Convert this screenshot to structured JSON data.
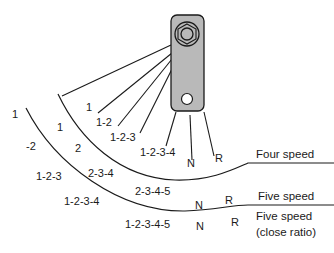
{
  "diagram": {
    "type": "gear-shift-pattern",
    "component": "selector lever",
    "rows": [
      {
        "name": "Four speed",
        "labels": [
          {
            "text": "1",
            "x": 86,
            "y": 108
          },
          {
            "text": "1-2",
            "x": 96,
            "y": 123
          },
          {
            "text": "1-2-3",
            "x": 110,
            "y": 138
          },
          {
            "text": "1-2-3-4",
            "x": 140,
            "y": 152
          },
          {
            "text": "N",
            "x": 187,
            "y": 163
          },
          {
            "text": "R",
            "x": 215,
            "y": 158
          }
        ]
      },
      {
        "name": "Five speed",
        "labels": [
          {
            "text": "1",
            "x": 57,
            "y": 127
          },
          {
            "text": "2",
            "x": 75,
            "y": 148
          },
          {
            "text": "2-3-4",
            "x": 88,
            "y": 173
          },
          {
            "text": "2-3-4-5",
            "x": 135,
            "y": 191
          },
          {
            "text": "N",
            "x": 195,
            "y": 205
          },
          {
            "text": "R",
            "x": 225,
            "y": 200
          }
        ]
      },
      {
        "name": "Five speed (close ratio)",
        "name_line1": "Five speed",
        "name_line2": "(close ratio)",
        "labels": [
          {
            "text": "1",
            "x": 12,
            "y": 114
          },
          {
            "text": "-2",
            "x": 26,
            "y": 146
          },
          {
            "text": "1-2-3",
            "x": 36,
            "y": 176
          },
          {
            "text": "1-2-3-4",
            "x": 64,
            "y": 201
          },
          {
            "text": "1-2-3-4-5",
            "x": 125,
            "y": 224
          },
          {
            "text": "N",
            "x": 196,
            "y": 226
          },
          {
            "text": "R",
            "x": 231,
            "y": 222
          }
        ]
      }
    ],
    "colors": {
      "line": "#1a1a1a",
      "lever_fill": "#b9b9b9",
      "lever_stroke": "#1a1a1a",
      "background": "#ffffff"
    }
  }
}
